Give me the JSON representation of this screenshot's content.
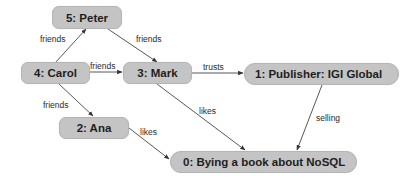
{
  "diagram": {
    "type": "graph",
    "nodes": [
      {
        "id": "5",
        "label": "5: Peter"
      },
      {
        "id": "4",
        "label": "4: Carol"
      },
      {
        "id": "3",
        "label": "3: Mark"
      },
      {
        "id": "1",
        "label": "1: Publisher: IGI Global"
      },
      {
        "id": "2",
        "label": "2: Ana"
      },
      {
        "id": "0",
        "label": "0: Bying a book about NoSQL"
      }
    ],
    "edges": [
      {
        "from": "4",
        "to": "5",
        "label": "friends"
      },
      {
        "from": "5",
        "to": "3",
        "label": "friends"
      },
      {
        "from": "4",
        "to": "3",
        "label": "friends"
      },
      {
        "from": "3",
        "to": "1",
        "label": "trusts"
      },
      {
        "from": "4",
        "to": "2",
        "label": "friends"
      },
      {
        "from": "3",
        "to": "0",
        "label": "likes"
      },
      {
        "from": "2",
        "to": "0",
        "label": "likes"
      },
      {
        "from": "1",
        "to": "0",
        "label": "selling"
      }
    ],
    "colors": {
      "node_fill": "#c4c4c4",
      "edge": "#333333",
      "text": "#1e1e1e"
    }
  }
}
